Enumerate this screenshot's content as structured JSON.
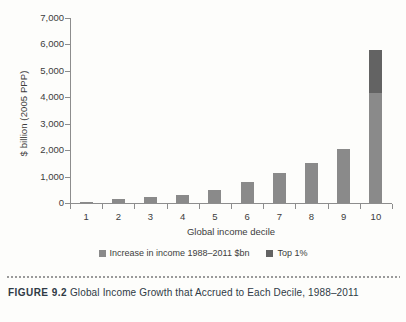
{
  "chart_data": {
    "type": "bar",
    "title": "",
    "subtitle": "",
    "xlabel": "Global income decile",
    "ylabel": "$ billion (2005 PPP)",
    "categories": [
      "1",
      "2",
      "3",
      "4",
      "5",
      "6",
      "7",
      "8",
      "9",
      "10"
    ],
    "ylim": [
      0,
      7000
    ],
    "ytick_values": [
      0,
      1000,
      2000,
      3000,
      4000,
      5000,
      6000,
      7000
    ],
    "ytick_labels": [
      "0",
      "1,000",
      "2,000",
      "3,000",
      "4,000",
      "5,000",
      "6,000",
      "7,000"
    ],
    "grid": false,
    "stacked": true,
    "legend_position": "bottom",
    "series": [
      {
        "name": "Increase in income 1988–2011 $bn",
        "color": "#8a8a8a",
        "values": [
          50,
          150,
          220,
          300,
          500,
          800,
          1150,
          1500,
          2050,
          4150
        ]
      },
      {
        "name": "Top 1%",
        "color": "#636363",
        "values": [
          0,
          0,
          0,
          0,
          0,
          0,
          0,
          0,
          0,
          1650
        ]
      }
    ],
    "totals": [
      50,
      150,
      220,
      300,
      500,
      800,
      1150,
      1500,
      2050,
      5800
    ]
  },
  "legend": {
    "entries": [
      {
        "label": "Increase in income 1988–2011 $bn",
        "color": "#8a8a8a"
      },
      {
        "label": "Top 1%",
        "color": "#636363"
      }
    ]
  },
  "caption": {
    "figure_number": "FIGURE 9.2",
    "text": " Global Income Growth that Accrued to Each Decile, 1988–2011"
  },
  "colors": {
    "background": "#fdfdfb",
    "axis": "#8d8d8d",
    "text": "#3c3c3c",
    "series_main": "#8a8a8a",
    "series_top": "#636363",
    "caption_text": "#2f3a45"
  }
}
